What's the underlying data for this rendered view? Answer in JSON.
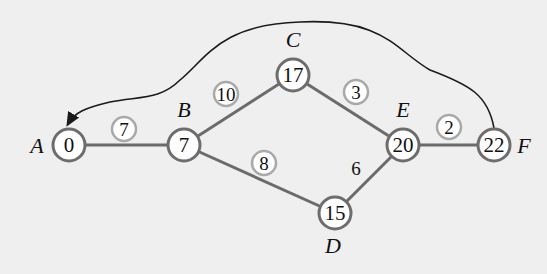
{
  "diagram": {
    "type": "network-critical-path",
    "nodes": [
      {
        "id": "A",
        "label": "A",
        "value": "0",
        "x": 69,
        "y": 145
      },
      {
        "id": "B",
        "label": "B",
        "value": "7",
        "x": 184,
        "y": 145
      },
      {
        "id": "C",
        "label": "C",
        "value": "17",
        "x": 293,
        "y": 75
      },
      {
        "id": "D",
        "label": "D",
        "value": "15",
        "x": 335,
        "y": 213
      },
      {
        "id": "E",
        "label": "E",
        "value": "20",
        "x": 403,
        "y": 145
      },
      {
        "id": "F",
        "label": "F",
        "value": "22",
        "x": 494,
        "y": 145
      }
    ],
    "edges": [
      {
        "from": "A",
        "to": "B",
        "weight": "7",
        "circled": true,
        "wx": 124,
        "wy": 129
      },
      {
        "from": "B",
        "to": "C",
        "weight": "10",
        "circled": true,
        "wx": 226,
        "wy": 94
      },
      {
        "from": "C",
        "to": "E",
        "weight": "3",
        "circled": true,
        "wx": 356,
        "wy": 92
      },
      {
        "from": "B",
        "to": "D",
        "weight": "8",
        "circled": true,
        "wx": 264,
        "wy": 163
      },
      {
        "from": "D",
        "to": "E",
        "weight": "6",
        "circled": false,
        "wx": 356,
        "wy": 168
      },
      {
        "from": "E",
        "to": "F",
        "weight": "2",
        "circled": true,
        "wx": 449,
        "wy": 127
      }
    ],
    "return_arc": {
      "from": "F",
      "to": "A",
      "arrow": "arrowhead-at-A"
    }
  }
}
